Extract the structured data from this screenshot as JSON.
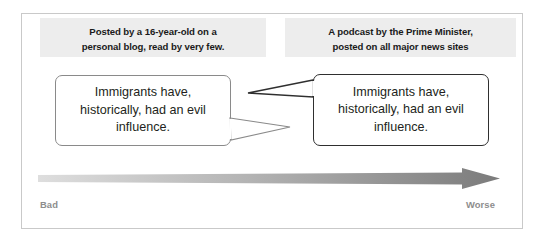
{
  "figure": {
    "frame_border_color": "#c9c9c9",
    "background": "#ffffff"
  },
  "captions": {
    "left": {
      "lines": [
        "Posted by a 16-year-old on a",
        "personal blog, read by very few."
      ],
      "background": "#ededed",
      "text_color": "#1a1a1a"
    },
    "right": {
      "lines": [
        "A podcast by the Prime Minister,",
        "posted on all major news sites"
      ],
      "background": "#ededed",
      "text_color": "#1a1a1a"
    }
  },
  "bubbles": {
    "left": {
      "text": "Immigrants have, historically, had an evil influence.",
      "border_color": "#8a8a8a",
      "tail_color": "#8a8a8a",
      "tail_direction": "right-down"
    },
    "right": {
      "text": "Immigrants have, historically, had an evil influence.",
      "border_color": "#2f2f2f",
      "tail_color": "#2f2f2f",
      "tail_direction": "left-up"
    }
  },
  "scale": {
    "start_label": "Bad",
    "end_label": "Worse",
    "label_color": "#8d8d8d",
    "gradient_start": "#dcdcdc",
    "gradient_end": "#7b7b7b",
    "direction": "left-to-right"
  }
}
